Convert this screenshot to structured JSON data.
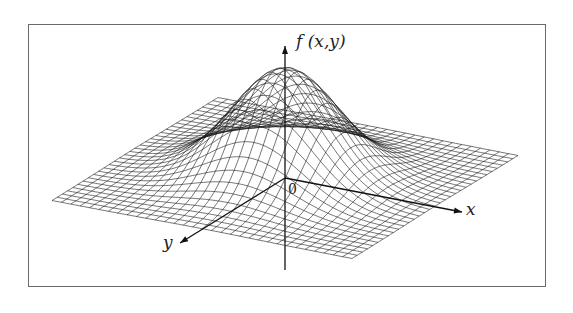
{
  "figure": {
    "z_label": "f (x,y)",
    "x_label": "x",
    "y_label": "y",
    "origin_label": "0",
    "colors": {
      "mesh": "#1a1a1a",
      "axis": "#111111",
      "frame": "#6a6a6a",
      "background": "#ffffff"
    }
  },
  "chart_data": {
    "type": "surface",
    "title": "",
    "function": "f(x,y) = exp(-(x^2 + y^2) / (2*sigma^2))",
    "sigma": 0.32,
    "x_range": [
      -1,
      1
    ],
    "y_range": [
      -1,
      1
    ],
    "grid_lines_per_axis": 33,
    "z_max": 1,
    "xlabel": "x",
    "ylabel": "y",
    "zlabel": "f (x,y)",
    "origin": "0"
  },
  "projection": {
    "origin_px": [
      285,
      178
    ],
    "x_dir_px": [
      150,
      29
    ],
    "y_dir_px": [
      -83,
      51.5
    ],
    "z_height_px": 109
  }
}
